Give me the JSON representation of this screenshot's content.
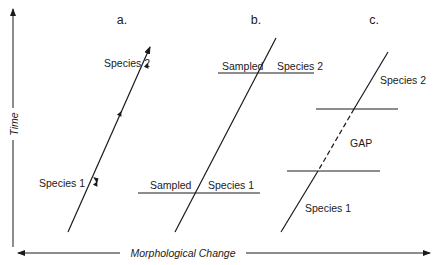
{
  "axes": {
    "y_label": "Time",
    "x_label": "Morphological Change"
  },
  "panels": [
    {
      "id": "a",
      "label": "a.",
      "species_top": "Species 2",
      "species_bottom": "Species 1"
    },
    {
      "id": "b",
      "label": "b.",
      "sampled_top": "Sampled",
      "species_top": "Species 2",
      "sampled_bottom": "Sampled",
      "species_bottom": "Species 1"
    },
    {
      "id": "c",
      "label": "c.",
      "species_top": "Species 2",
      "gap": "GAP",
      "species_bottom": "Species 1"
    }
  ],
  "colors": {
    "ink": "#1a1a1a",
    "background": "#ffffff"
  }
}
